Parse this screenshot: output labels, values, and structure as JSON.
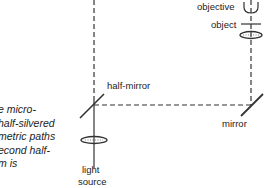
{
  "labels": {
    "objective": "objective",
    "object": "object",
    "half_mirror": "half-mirror",
    "mirror": "mirror",
    "light": "light",
    "source": "source"
  },
  "caption": {
    "lines": [
      "e micro-",
      "half-silvered",
      "metric paths",
      "econd half-",
      "m is"
    ]
  },
  "colors": {
    "line": "#333333",
    "text": "#222222",
    "background": "#ffffff"
  }
}
